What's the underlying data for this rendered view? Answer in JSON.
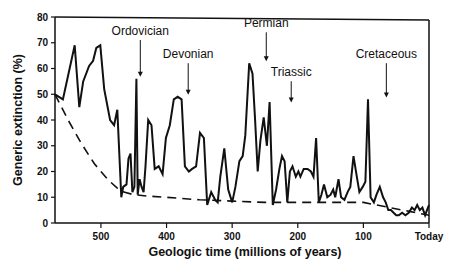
{
  "chart_data": {
    "type": "line",
    "title": "",
    "xlabel": "Geologic time (millions of years)",
    "ylabel": "Generic extinction (%)",
    "xlim": [
      570,
      0
    ],
    "ylim": [
      0,
      80
    ],
    "grid": false,
    "legend": null,
    "x_ticks": [
      {
        "value": 500,
        "label": "500"
      },
      {
        "value": 400,
        "label": "400"
      },
      {
        "value": 300,
        "label": "300"
      },
      {
        "value": 200,
        "label": "200"
      },
      {
        "value": 100,
        "label": "100"
      },
      {
        "value": 0,
        "label": "Today"
      }
    ],
    "y_ticks": [
      0,
      10,
      20,
      30,
      40,
      50,
      60,
      70,
      80
    ],
    "series": [
      {
        "name": "Generic extinction",
        "style": "solid",
        "x": [
          570,
          558,
          540,
          533,
          527,
          518,
          512,
          507,
          501,
          495,
          486,
          480,
          475,
          469,
          466,
          461,
          458,
          455,
          452,
          449,
          446,
          444,
          441,
          438,
          435,
          432,
          428,
          423,
          418,
          412,
          406,
          401,
          395,
          389,
          383,
          377,
          372,
          366,
          361,
          355,
          349,
          343,
          338,
          332,
          326,
          322,
          318,
          312,
          306,
          300,
          295,
          289,
          284,
          280,
          274,
          269,
          265,
          261,
          257,
          252,
          247,
          243,
          238,
          233,
          228,
          224,
          220,
          216,
          212,
          208,
          203,
          199,
          196,
          191,
          185,
          180,
          176,
          172,
          168,
          164,
          160,
          155,
          150,
          146,
          143,
          138,
          134,
          129,
          124,
          120,
          115,
          110,
          106,
          101,
          97,
          93,
          89,
          84,
          80,
          75,
          70,
          66,
          62,
          58,
          54,
          50,
          46,
          41,
          36,
          31,
          26,
          22,
          18,
          14,
          10,
          6,
          3,
          0
        ],
        "y": [
          50,
          48,
          69,
          45,
          55,
          61,
          63,
          68,
          69,
          52,
          40,
          38,
          44,
          10,
          14,
          15,
          25,
          27,
          12,
          14,
          56,
          11,
          17,
          14,
          12,
          22,
          40,
          38,
          21,
          22,
          19,
          33,
          38,
          48,
          49,
          48,
          22,
          20,
          21,
          22,
          35,
          33,
          7,
          12,
          9,
          8,
          18,
          29,
          13,
          8,
          14,
          24,
          26,
          34,
          62,
          58,
          40,
          20,
          32,
          41,
          30,
          47,
          7,
          13,
          21,
          26,
          24,
          8,
          20,
          22,
          18,
          20,
          18,
          21,
          21,
          20,
          18,
          33,
          8,
          11,
          15,
          10,
          11,
          13,
          10,
          17,
          10,
          9,
          12,
          14,
          26,
          18,
          12,
          14,
          16,
          48,
          10,
          8,
          11,
          14,
          10,
          8,
          5,
          5,
          4,
          3,
          3,
          4,
          3,
          4,
          6,
          5,
          7,
          5,
          6,
          3,
          5,
          7
        ],
        "color": "#111111"
      },
      {
        "name": "Background extinction",
        "style": "dashed",
        "x": [
          570,
          550,
          530,
          510,
          490,
          475,
          465,
          450,
          430,
          400,
          350,
          300,
          250,
          200,
          150,
          100,
          60,
          30,
          0
        ],
        "y": [
          50,
          40,
          31,
          23,
          17,
          13.5,
          12,
          11,
          10.5,
          10,
          9,
          8.5,
          8,
          8,
          8,
          8,
          6,
          4.5,
          3
        ],
        "color": "#111111"
      }
    ],
    "annotations": [
      {
        "label": "Ordovician",
        "x": 440,
        "y": 56,
        "text_y": 73
      },
      {
        "label": "Devonian",
        "x": 367,
        "y": 49,
        "text_y": 64
      },
      {
        "label": "Permian",
        "x": 248,
        "y": 62,
        "text_y": 76
      },
      {
        "label": "Triassic",
        "x": 210,
        "y": 46,
        "text_y": 57
      },
      {
        "label": "Cretaceous",
        "x": 65,
        "y": 48,
        "text_y": 64
      }
    ]
  }
}
